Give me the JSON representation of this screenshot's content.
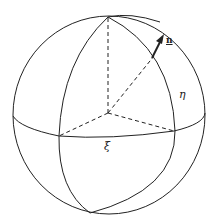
{
  "figure": {
    "labels": {
      "normal": "n",
      "eta": "η",
      "xi": "ξ"
    },
    "colors": {
      "stroke": "#222222",
      "background": "#ffffff"
    }
  }
}
